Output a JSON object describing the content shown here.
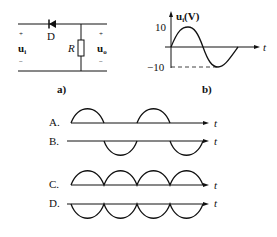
{
  "figure_a": {
    "caption": "a)",
    "diode_label": "D",
    "resistor_label": "R",
    "input": {
      "plus": "+",
      "minus": "−",
      "label": "u",
      "subscript": "i"
    },
    "output": {
      "plus": "+",
      "minus": "−",
      "label": "u",
      "subscript": "o"
    }
  },
  "figure_b": {
    "caption": "b)",
    "y_label": "u",
    "y_label_sub": "i",
    "y_label_unit": "(V)",
    "x_label": "t",
    "ticks": [
      "10",
      "−10"
    ]
  },
  "options": [
    {
      "letter": "A.",
      "axis_label": "t",
      "shape": "half-wave positive"
    },
    {
      "letter": "B.",
      "axis_label": "t",
      "shape": "half-wave negative"
    },
    {
      "letter": "C.",
      "axis_label": "t",
      "shape": "full-wave positive"
    },
    {
      "letter": "D.",
      "axis_label": "t",
      "shape": "full-wave negative"
    }
  ]
}
